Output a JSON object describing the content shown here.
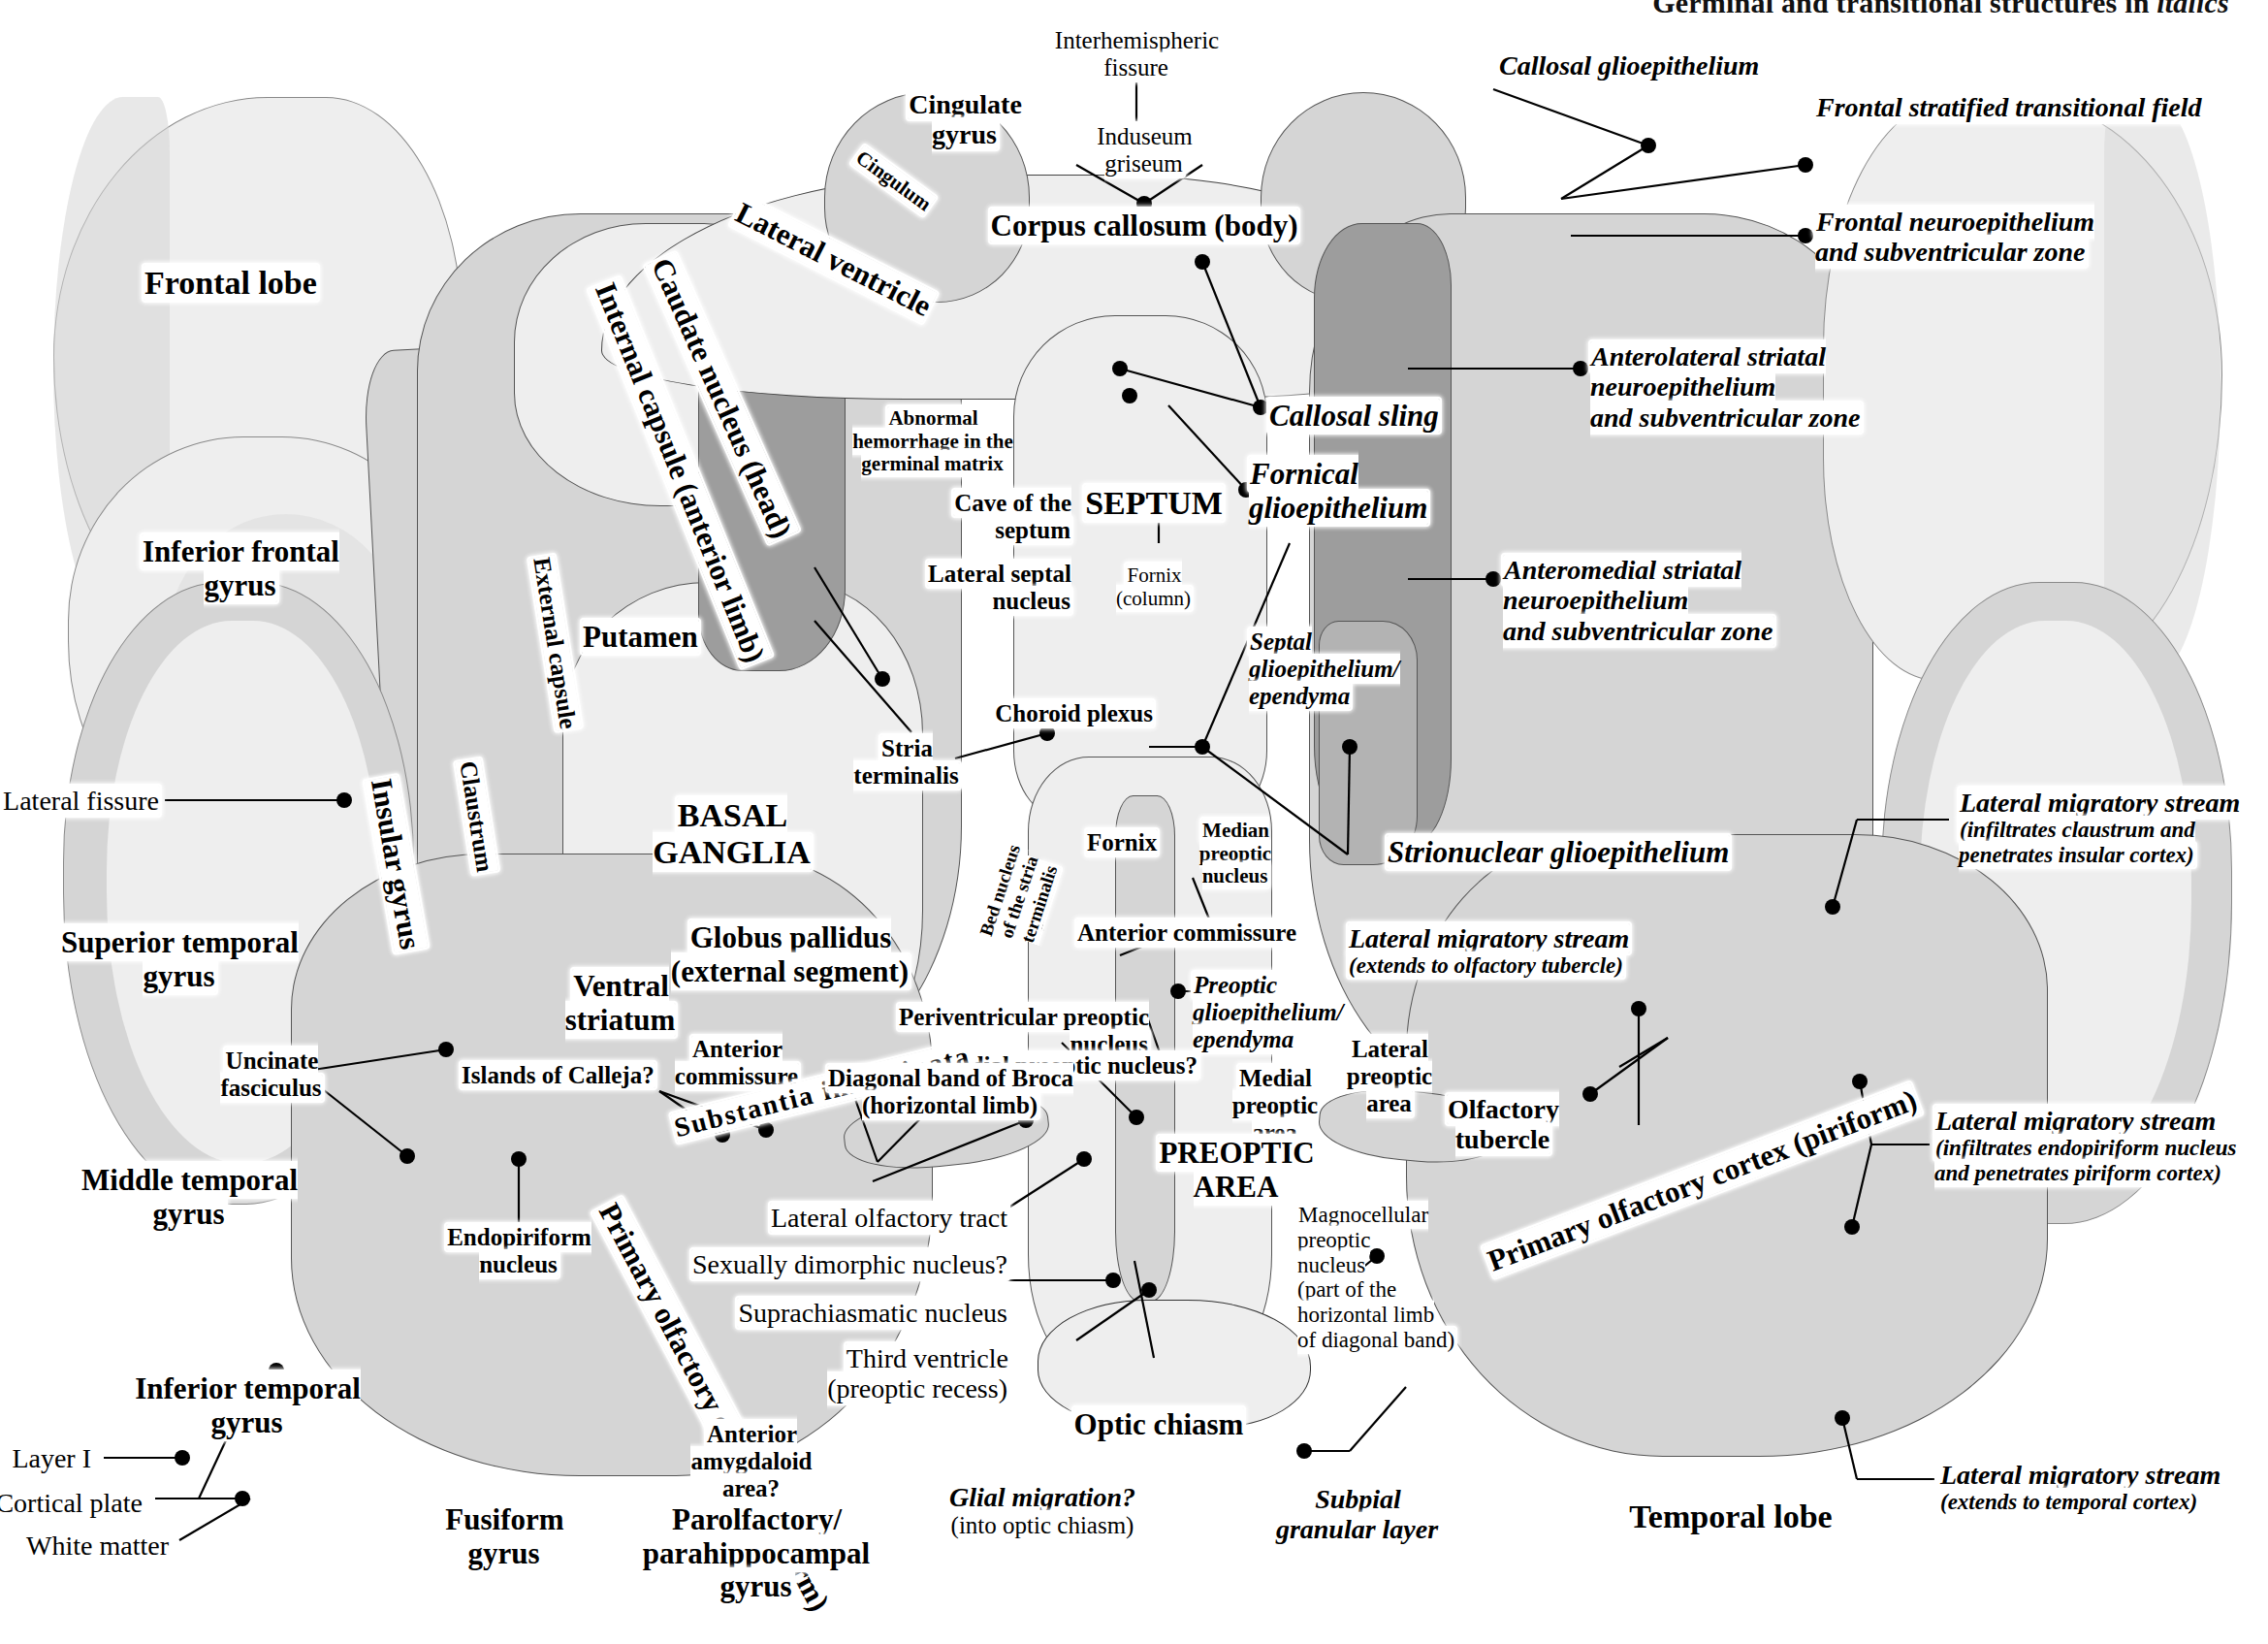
{
  "header": {
    "text_plain": "Germinal and transitional structures in ",
    "text_italic": "italics",
    "full": "Germinal and transitional structures in italics"
  },
  "figure": {
    "type": "anatomical-atlas-plate"
  },
  "labels": {
    "interhemispheric_fissure": "Interhemispheric\nfissure",
    "callosal_glioepithelium": "Callosal glioepithelium",
    "frontal_stratified_transitional_field": "Frontal stratified transitional field",
    "frontal_neuroepithelium": "Frontal neuroepithelium\nand subventricular zone",
    "cingulate_gyrus": "Cingulate\ngyrus",
    "cingulum": "Cingulum",
    "induseum_griseum": "Induseum\ngriseum",
    "corpus_callosum_body": "Corpus callosum (body)",
    "lateral_ventricle": "Lateral ventricle",
    "caudate_nucleus_head": "Caudate nucleus (head)",
    "internal_capsule_anterior_limb": "Internal capsule (anterior limb)",
    "external_capsule": "External capsule",
    "claustrum": "Claustrum",
    "insular_gyrus": "Insular gyrus",
    "frontal_lobe": "Frontal lobe",
    "inferior_frontal_gyrus": "Inferior frontal\ngyrus",
    "lateral_fissure": "Lateral fissure",
    "putamen": "Putamen",
    "abnormal_hemorrhage": "Abnormal\nhemorrhage in the\ngerminal matrix",
    "cave_of_the_septum": "Cave of the\nseptum",
    "lateral_septal_nucleus": "Lateral septal\nnucleus",
    "septum": "SEPTUM",
    "fornix_column": "Fornix\n(column)",
    "callosal_sling": "Callosal sling",
    "fornical_glioepithelium": "Fornical\nglioepithelium",
    "anterolateral_striatal": "Anterolateral striatal neuroepithelium\nand subventricular zone",
    "anteromedial_striatal": "Anteromedial striatal neuroepithelium\nand subventricular zone",
    "septal_glioepithelium": "Septal\nglioepithelium/\nependyma",
    "choroid_plexus": "Choroid plexus",
    "stria_terminalis": "Stria\nterminalis",
    "basal_ganglia": "BASAL\nGANGLIA",
    "globus_pallidus": "Globus pallidus\n(external segment)",
    "ventral_striatum": "Ventral\nstriatum",
    "fornix": "Fornix",
    "median_preoptic_nucleus": "Median\npreoptic\nnucleus",
    "bed_nucleus_stria_terminalis": "Bed nucleus\nof the stria\nterminalis",
    "anterior_commissure_lower": "Anterior commissure",
    "strionuclear_glioepithelium": "Strionuclear glioepithelium",
    "lateral_migratory_stream_insular": "Lateral migratory stream",
    "lateral_migratory_stream_insular_sub": "(infiltrates claustrum and\npenetrates insular cortex)",
    "lateral_migratory_stream_tubercle": "Lateral migratory stream",
    "lateral_migratory_stream_tubercle_sub": "(extends to olfactory tubercle)",
    "lateral_migratory_stream_piriform": "Lateral migratory stream",
    "lateral_migratory_stream_piriform_sub": "(infiltrates endopiriform nucleus\nand penetrates piriform cortex)",
    "lateral_migratory_stream_temporal": "Lateral migratory stream",
    "lateral_migratory_stream_temporal_sub": "(extends to temporal cortex)",
    "periventricular_preoptic_nucleus": "Periventricular preoptic nucleus",
    "medial_preoptic_nucleus_q": "Medial preoptic nucleus?",
    "preoptic_glioepithelium": "Preoptic\nglioepithelium/\nependyma",
    "medial_preoptic_area": "Medial\npreoptic\narea",
    "lateral_preoptic_area": "Lateral\npreoptic\narea",
    "preoptic_area": "PREOPTIC\nAREA",
    "olfactory_tubercle": "Olfactory\ntubercle",
    "magnocellular_preoptic_nucleus": "Magnocellular\npreoptic\nnucleus\n(part of the\nhorizontal limb\nof diagonal band)",
    "superior_temporal_gyrus": "Superior temporal\ngyrus",
    "middle_temporal_gyrus": "Middle temporal\ngyrus",
    "inferior_temporal_gyrus": "Inferior temporal\ngyrus",
    "uncinate_fasciculus": "Uncinate\nfasciculus",
    "islands_of_calleja_q": "Islands of Calleja?",
    "anterior_commissure_upper": "Anterior\ncommissure",
    "substantia_innominata": "Substantia innominata",
    "diagonal_band_of_broca": "Diagonal band of Broca\n(horizontal limb)",
    "endopiriform_nucleus": "Endopiriform\nnucleus",
    "primary_olfactory_cortex_left": "Primary olfactory cortex (piriform)",
    "primary_olfactory_cortex_right": "Primary olfactory cortex (piriform)",
    "lateral_olfactory_tract": "Lateral olfactory tract",
    "sexually_dimorphic_nucleus_q": "Sexually dimorphic nucleus?",
    "suprachiasmatic_nucleus": "Suprachiasmatic nucleus",
    "third_ventricle": "Third ventricle\n(preoptic recess)",
    "layer_i": "Layer I",
    "cortical_plate": "Cortical plate",
    "white_matter": "White matter",
    "fusiform_gyrus": "Fusiform\ngyrus",
    "anterior_amygdaloid_area_q": "Anterior\namygdaloid\narea?",
    "parolfactory_parahippocampal_gyrus": "Parolfactory/\nparahippocampal\ngyrus",
    "optic_chiasm": "Optic chiasm",
    "glial_migration_q": "Glial migration?",
    "glial_migration_sub": "(into optic chiasm)",
    "subpial_granular_layer": "Subpial\ngranular layer",
    "temporal_lobe": "Temporal lobe"
  },
  "colors": {
    "ink": "#000000",
    "paper": "#ffffff",
    "tissue_light": "#eeeeee",
    "tissue_mid": "#d5d5d5",
    "tissue_dark": "#b3b3b3",
    "germinal_matrix": "#9a9a9a"
  }
}
